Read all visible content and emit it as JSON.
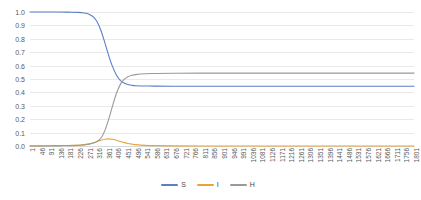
{
  "chart_data": {
    "type": "line",
    "title": "",
    "xlabel": "",
    "ylabel": "",
    "ylim": [
      0.0,
      1.0
    ],
    "xlim": [
      1,
      1801
    ],
    "grid": true,
    "legend_position": "bottom-center",
    "y_ticks": [
      "0.0",
      "0.1",
      "0.2",
      "0.3",
      "0.4",
      "0.5",
      "0.6",
      "0.7",
      "0.8",
      "0.9",
      "1.0"
    ],
    "x_ticks": [
      "1",
      "46",
      "91",
      "136",
      "181",
      "226",
      "271",
      "316",
      "361",
      "406",
      "451",
      "496",
      "541",
      "586",
      "631",
      "676",
      "721",
      "766",
      "811",
      "856",
      "901",
      "946",
      "991",
      "1036",
      "1081",
      "1126",
      "1171",
      "1216",
      "1261",
      "1306",
      "1351",
      "1396",
      "1441",
      "1486",
      "1531",
      "1576",
      "1621",
      "1666",
      "1711",
      "1756",
      "1801"
    ],
    "x_tick_step": 45,
    "colors": {
      "S": "#5b7fc7",
      "I": "#e8a33d",
      "H": "#9a9a94",
      "gridline": "#e9e9e9",
      "axis_text": "#5a5a5a"
    },
    "series": [
      {
        "name": "S",
        "color": "#5b7fc7",
        "x": [
          1,
          46,
          91,
          136,
          181,
          226,
          244,
          262,
          280,
          298,
          316,
          334,
          352,
          370,
          388,
          406,
          424,
          442,
          460,
          478,
          496,
          541,
          586,
          676,
          811,
          991,
          1216,
          1441,
          1621,
          1801
        ],
        "values": [
          1.0,
          1.0,
          1.0,
          1.0,
          0.999,
          0.997,
          0.995,
          0.991,
          0.982,
          0.963,
          0.925,
          0.86,
          0.77,
          0.675,
          0.592,
          0.53,
          0.49,
          0.47,
          0.459,
          0.453,
          0.45,
          0.448,
          0.447,
          0.446,
          0.446,
          0.446,
          0.446,
          0.446,
          0.446,
          0.446
        ]
      },
      {
        "name": "I",
        "color": "#e8a33d",
        "x": [
          1,
          46,
          91,
          136,
          181,
          226,
          244,
          262,
          280,
          298,
          316,
          334,
          352,
          370,
          388,
          406,
          424,
          442,
          460,
          478,
          496,
          541,
          586,
          676,
          811,
          991,
          1216,
          1441,
          1621,
          1801
        ],
        "values": [
          0.001,
          0.001,
          0.002,
          0.003,
          0.004,
          0.007,
          0.009,
          0.012,
          0.017,
          0.024,
          0.033,
          0.043,
          0.05,
          0.053,
          0.05,
          0.043,
          0.034,
          0.026,
          0.019,
          0.014,
          0.01,
          0.005,
          0.003,
          0.001,
          0.0,
          0.0,
          0.0,
          0.0,
          0.0,
          0.0
        ]
      },
      {
        "name": "H",
        "color": "#9a9a94",
        "x": [
          1,
          46,
          91,
          136,
          181,
          226,
          244,
          262,
          280,
          298,
          316,
          334,
          352,
          370,
          388,
          406,
          424,
          442,
          460,
          478,
          496,
          541,
          586,
          676,
          811,
          991,
          1216,
          1441,
          1621,
          1801
        ],
        "values": [
          0.0,
          0.0,
          0.0,
          0.001,
          0.002,
          0.004,
          0.006,
          0.009,
          0.014,
          0.022,
          0.035,
          0.06,
          0.115,
          0.2,
          0.3,
          0.392,
          0.458,
          0.497,
          0.517,
          0.527,
          0.533,
          0.539,
          0.541,
          0.543,
          0.544,
          0.544,
          0.544,
          0.544,
          0.544,
          0.544
        ]
      }
    ],
    "legend": [
      {
        "label": "S",
        "color": "#5b7fc7"
      },
      {
        "label": "I",
        "color": "#e8a33d"
      },
      {
        "label": "H",
        "color": "#9a9a94"
      }
    ]
  }
}
